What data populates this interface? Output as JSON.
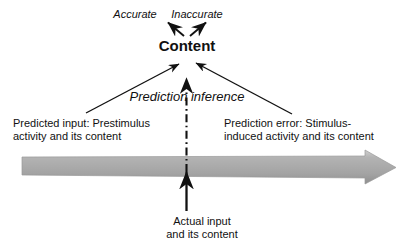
{
  "figure": {
    "type": "concept-diagram",
    "background_color": "#ffffff",
    "text_color": "#111111",
    "axis_arrow_color": "#a8a8a8"
  },
  "labels": {
    "accurate": "Accurate",
    "inaccurate": "Inaccurate",
    "content": "Content",
    "prediction_inference": "Prediction inference",
    "predicted_input_line1": "Predicted input: Prestimulus",
    "predicted_input_line2": "activity and its content",
    "prediction_error_line1": "Prediction error: Stimulus-",
    "prediction_error_line2": "induced activity and its content",
    "actual_input_line1": "Actual input",
    "actual_input_line2": "and its content"
  },
  "connectors": [
    {
      "name": "content-to-accurate",
      "style": "solid",
      "color": "#111111",
      "from": "Content",
      "to": "Accurate"
    },
    {
      "name": "content-to-inaccurate",
      "style": "solid",
      "color": "#111111",
      "from": "Content",
      "to": "Inaccurate"
    },
    {
      "name": "predicted-input-to-content",
      "style": "solid",
      "color": "#111111",
      "from": "Predicted input: Prestimulus activity and its content",
      "to": "Content"
    },
    {
      "name": "prediction-error-to-content",
      "style": "solid",
      "color": "#111111",
      "from": "Prediction error: Stimulus-induced activity and its content",
      "to": "Content"
    },
    {
      "name": "prediction-inference-dashdot",
      "style": "dash-dot",
      "color": "#111111",
      "from": "Actual input and its content",
      "to": "Content"
    },
    {
      "name": "actual-input-to-timeline",
      "style": "solid",
      "color": "#111111",
      "from": "Actual input and its content",
      "to": "timeline"
    },
    {
      "name": "timeline-arrow",
      "style": "solid-block",
      "color": "#a8a8a8",
      "from": "left",
      "to": "right"
    }
  ]
}
